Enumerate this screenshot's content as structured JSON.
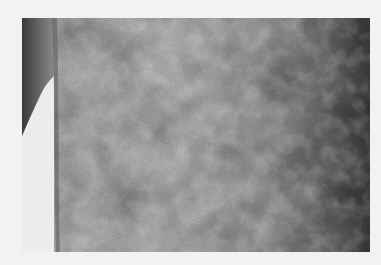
{
  "image": {
    "description": "Grayscale clinical photograph of skin showing a mottled, lace-like (reticular) pattern",
    "alt": "Close-up of mottled skin surface",
    "colors": {
      "background": "#f2f2f2",
      "skin_light": "#c4c4c4",
      "skin_mid": "#9a9a9a",
      "skin_dark": "#3e3e3e",
      "gap_background": "#ececec"
    }
  }
}
